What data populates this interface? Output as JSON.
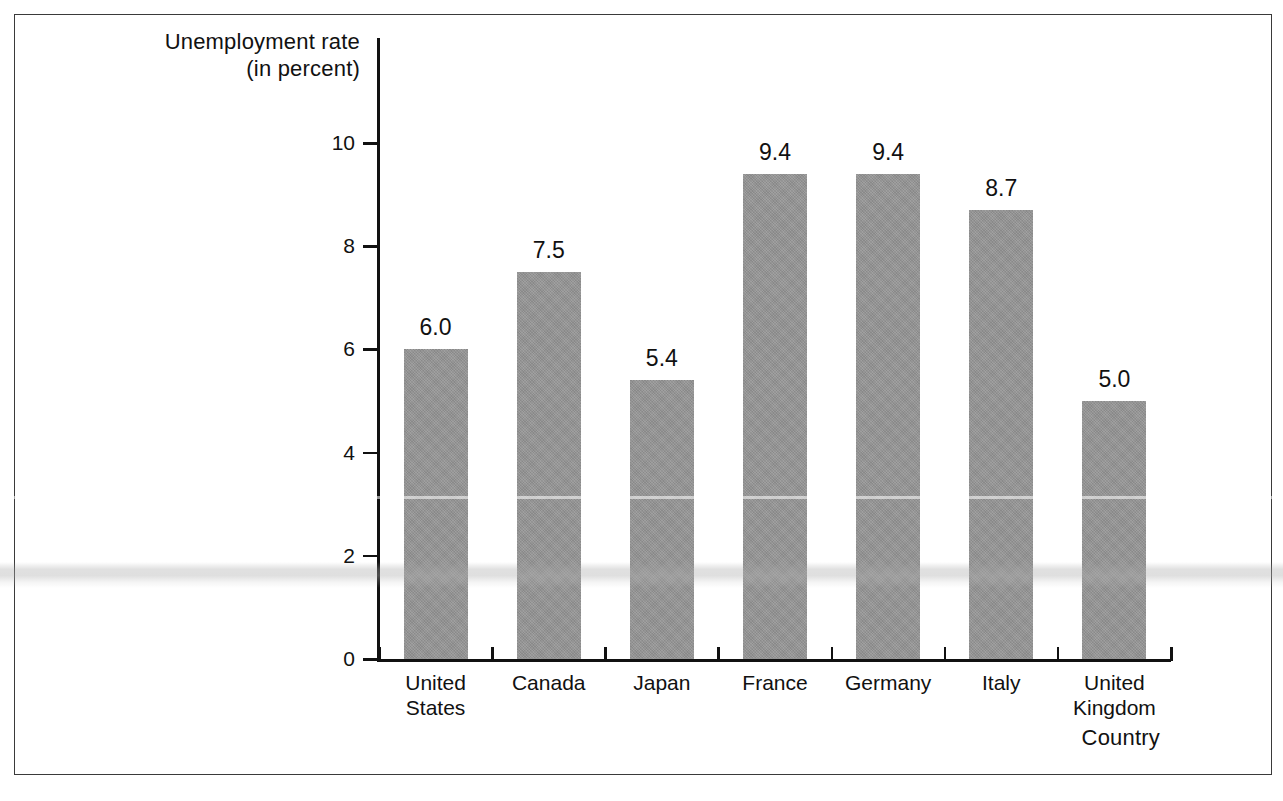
{
  "chart_data": {
    "type": "bar",
    "title": "",
    "subtitle": "",
    "xlabel": "Country",
    "ylabel": "Unemployment rate (in percent)",
    "ylabel_line1": "Unemployment rate",
    "ylabel_line2": "(in percent)",
    "categories": [
      "United States",
      "Canada",
      "Japan",
      "France",
      "Germany",
      "Italy",
      "United Kingdom"
    ],
    "category_lines": [
      [
        "United",
        "States"
      ],
      [
        "Canada"
      ],
      [
        "Japan"
      ],
      [
        "France"
      ],
      [
        "Germany"
      ],
      [
        "Italy"
      ],
      [
        "United",
        "Kingdom"
      ]
    ],
    "values": [
      6.0,
      7.5,
      5.4,
      9.4,
      9.4,
      8.7,
      5.0
    ],
    "value_labels": [
      "6.0",
      "7.5",
      "5.4",
      "9.4",
      "9.4",
      "8.7",
      "5.0"
    ],
    "ylim": [
      0,
      10
    ],
    "yticks": [
      0,
      2,
      4,
      6,
      8,
      10
    ],
    "ytick_labels": [
      "0",
      "2",
      "4",
      "6",
      "8",
      "10"
    ],
    "grid": false,
    "legend": null,
    "legend_position": "none",
    "bar_color": "#969696",
    "axis_color": "#111111",
    "background_color": "#ffffff",
    "frame_color": "#3a3a3a"
  }
}
